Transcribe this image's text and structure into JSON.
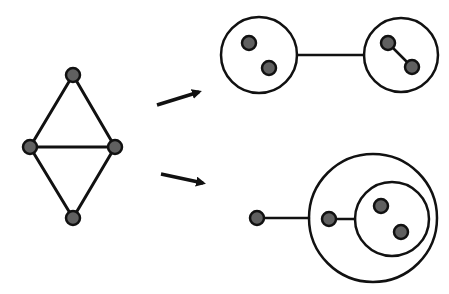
{
  "diagram": {
    "type": "graph-decomposition",
    "colors": {
      "background": "#ffffff",
      "stroke": "#111111",
      "node_fill": "#606060"
    },
    "source_graph": {
      "nodes": [
        {
          "id": "top",
          "x": 73,
          "y": 75
        },
        {
          "id": "left",
          "x": 30,
          "y": 147
        },
        {
          "id": "right",
          "x": 115,
          "y": 147
        },
        {
          "id": "bottom",
          "x": 73,
          "y": 218
        }
      ],
      "edges": [
        [
          "top",
          "left"
        ],
        [
          "top",
          "right"
        ],
        [
          "left",
          "right"
        ],
        [
          "left",
          "bottom"
        ],
        [
          "right",
          "bottom"
        ]
      ]
    },
    "arrows": [
      {
        "x1": 157,
        "y1": 105,
        "x2": 199,
        "y2": 92
      },
      {
        "x1": 161,
        "y1": 174,
        "x2": 203,
        "y2": 183
      }
    ],
    "result_top": {
      "clusters": [
        {
          "cx": 259,
          "cy": 55,
          "r": 38
        },
        {
          "cx": 401,
          "cy": 55,
          "r": 37
        }
      ],
      "nodes": [
        {
          "x": 249,
          "y": 43
        },
        {
          "x": 269,
          "y": 68
        },
        {
          "x": 388,
          "y": 43
        },
        {
          "x": 412,
          "y": 67
        }
      ],
      "edges": [
        {
          "x1": 297,
          "y1": 55,
          "x2": 364,
          "y2": 55
        },
        {
          "x1": 388,
          "y1": 43,
          "x2": 412,
          "y2": 67
        }
      ]
    },
    "result_bottom": {
      "clusters": [
        {
          "cx": 373,
          "cy": 218,
          "r": 64
        },
        {
          "cx": 392,
          "cy": 219,
          "r": 37
        }
      ],
      "nodes": [
        {
          "x": 257,
          "y": 218
        },
        {
          "x": 329,
          "y": 219
        },
        {
          "x": 381,
          "y": 206
        },
        {
          "x": 401,
          "y": 232
        }
      ],
      "edges": [
        {
          "x1": 257,
          "y1": 218,
          "x2": 309,
          "y2": 218
        },
        {
          "x1": 329,
          "y1": 219,
          "x2": 355,
          "y2": 219
        }
      ]
    }
  }
}
